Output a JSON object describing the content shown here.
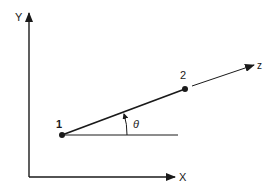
{
  "diagram": {
    "axes": {
      "y_label": "Y",
      "x_label": "X"
    },
    "points": [
      {
        "label": "1"
      },
      {
        "label": "2"
      }
    ],
    "direction_label": "z",
    "angle_label": "θ",
    "colors": {
      "stroke": "#1a1a1a",
      "background": "#ffffff"
    }
  }
}
